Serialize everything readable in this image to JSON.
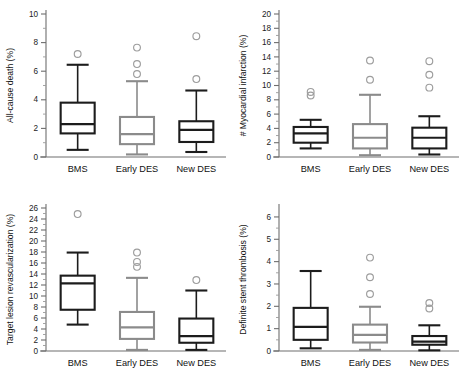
{
  "figure": {
    "title": "",
    "panel_count": 4,
    "categories": [
      "BMS",
      "Early DES",
      "New DES"
    ],
    "series_colors": {
      "BMS": "#1c1c1c",
      "Early DES": "#8b8b8b",
      "New DES": "#1c1c1c"
    },
    "outlier_color": "#9d9d9d",
    "axis_color": "#6e6e6e",
    "background": "#ffffff"
  },
  "chart_data": [
    {
      "type": "box",
      "panel_id": "all-cause-death",
      "title": "",
      "xlabel": "",
      "ylabel": "All-cause death (%)",
      "categories": [
        "BMS",
        "Early DES",
        "New DES"
      ],
      "ylim": [
        0,
        10
      ],
      "ytick_step": 2,
      "yminor_step": 1,
      "yticks": [
        0,
        2,
        4,
        6,
        8,
        10
      ],
      "grid": false,
      "legend": "none",
      "boxes": [
        {
          "name": "BMS",
          "color": "#1c1c1c",
          "whisker_low": 0.5,
          "q1": 1.65,
          "median": 2.3,
          "q3": 3.8,
          "whisker_high": 6.45,
          "outliers": [
            7.2
          ]
        },
        {
          "name": "Early DES",
          "color": "#8b8b8b",
          "whisker_low": 0.18,
          "q1": 0.9,
          "median": 1.6,
          "q3": 2.8,
          "whisker_high": 5.3,
          "outliers": [
            5.8,
            6.5,
            7.65
          ]
        },
        {
          "name": "New DES",
          "color": "#1c1c1c",
          "whisker_low": 0.35,
          "q1": 1.05,
          "median": 1.9,
          "q3": 2.5,
          "whisker_high": 4.65,
          "outliers": [
            5.45,
            8.45
          ]
        }
      ]
    },
    {
      "type": "box",
      "panel_id": "myocardial-infarction",
      "title": "",
      "xlabel": "",
      "ylabel": "# Myocardial infarction (%)",
      "categories": [
        "BMS",
        "Early DES",
        "New DES"
      ],
      "ylim": [
        0,
        20
      ],
      "ytick_step": 2,
      "yminor_step": 1,
      "yticks": [
        0,
        2,
        4,
        6,
        8,
        10,
        12,
        14,
        16,
        18,
        20
      ],
      "grid": false,
      "legend": "none",
      "boxes": [
        {
          "name": "BMS",
          "color": "#1c1c1c",
          "whisker_low": 1.2,
          "q1": 2.0,
          "median": 3.3,
          "q3": 4.2,
          "whisker_high": 5.2,
          "outliers": [
            8.6,
            9.1
          ]
        },
        {
          "name": "Early DES",
          "color": "#8b8b8b",
          "whisker_low": 0.25,
          "q1": 1.2,
          "median": 2.7,
          "q3": 4.6,
          "whisker_high": 8.7,
          "outliers": [
            10.8,
            13.5
          ]
        },
        {
          "name": "New DES",
          "color": "#1c1c1c",
          "whisker_low": 0.35,
          "q1": 1.2,
          "median": 2.7,
          "q3": 4.1,
          "whisker_high": 5.7,
          "outliers": [
            9.7,
            11.5,
            13.4
          ]
        }
      ]
    },
    {
      "type": "box",
      "panel_id": "target-lesion-revascularization",
      "title": "",
      "xlabel": "",
      "ylabel": "Target lesion revascularization (%)",
      "categories": [
        "BMS",
        "Early DES",
        "New DES"
      ],
      "ylim": [
        0,
        26
      ],
      "ytick_step": 2,
      "yminor_step": 1,
      "yticks": [
        0,
        2,
        4,
        6,
        8,
        10,
        12,
        14,
        16,
        18,
        20,
        22,
        24,
        26
      ],
      "grid": false,
      "legend": "none",
      "boxes": [
        {
          "name": "BMS",
          "color": "#1c1c1c",
          "whisker_low": 4.8,
          "q1": 7.5,
          "median": 12.3,
          "q3": 13.7,
          "whisker_high": 17.9,
          "outliers": [
            24.9
          ]
        },
        {
          "name": "Early DES",
          "color": "#8b8b8b",
          "whisker_low": 0.2,
          "q1": 2.2,
          "median": 4.3,
          "q3": 7.1,
          "whisker_high": 13.3,
          "outliers": [
            15.3,
            16.2,
            17.9
          ]
        },
        {
          "name": "New DES",
          "color": "#1c1c1c",
          "whisker_low": 0.2,
          "q1": 1.5,
          "median": 2.7,
          "q3": 5.9,
          "whisker_high": 11.0,
          "outliers": [
            12.9
          ]
        }
      ]
    },
    {
      "type": "box",
      "panel_id": "definite-stent-thrombosis",
      "title": "",
      "xlabel": "",
      "ylabel": "Definite stent  thrombosis (%)",
      "categories": [
        "BMS",
        "Early DES",
        "New DES"
      ],
      "ylim": [
        0,
        6.4
      ],
      "ytick_step": 1,
      "yminor_step": 0.5,
      "yticks": [
        0,
        1,
        2,
        3,
        4,
        5,
        6
      ],
      "grid": false,
      "legend": "none",
      "boxes": [
        {
          "name": "BMS",
          "color": "#1c1c1c",
          "whisker_low": 0.12,
          "q1": 0.5,
          "median": 1.08,
          "q3": 1.93,
          "whisker_high": 3.58,
          "outliers": []
        },
        {
          "name": "Early DES",
          "color": "#8b8b8b",
          "whisker_low": 0.05,
          "q1": 0.38,
          "median": 0.72,
          "q3": 1.18,
          "whisker_high": 1.98,
          "outliers": [
            2.55,
            3.3,
            4.18
          ]
        },
        {
          "name": "New DES",
          "color": "#1c1c1c",
          "whisker_low": 0.03,
          "q1": 0.28,
          "median": 0.42,
          "q3": 0.67,
          "whisker_high": 1.15,
          "outliers": [
            1.9,
            2.15
          ]
        }
      ]
    }
  ]
}
